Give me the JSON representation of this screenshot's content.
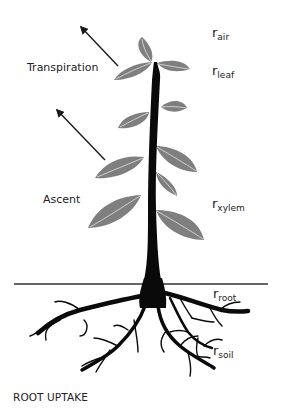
{
  "diagram": {
    "title": "ROOT UPTAKE",
    "process_labels": [
      {
        "id": "transpiration",
        "text": "Transpiration"
      },
      {
        "id": "ascent",
        "text": "Ascent"
      }
    ],
    "resistance_labels": [
      {
        "id": "r-air",
        "symbol": "r",
        "subscript": "air"
      },
      {
        "id": "r-leaf",
        "symbol": "r",
        "subscript": "leaf"
      },
      {
        "id": "r-xylem",
        "symbol": "r",
        "subscript": "xylem"
      },
      {
        "id": "r-root",
        "symbol": "r",
        "subscript": "root"
      },
      {
        "id": "r-soil",
        "symbol": "r",
        "subscript": "soil"
      }
    ],
    "colors": {
      "stem": "#0a0a0a",
      "leaf": "#7f7f7f",
      "leaf_vein": "#d6d6d6",
      "arrow": "#1a1a1a",
      "ground": "#333333",
      "text": "#222222"
    }
  }
}
